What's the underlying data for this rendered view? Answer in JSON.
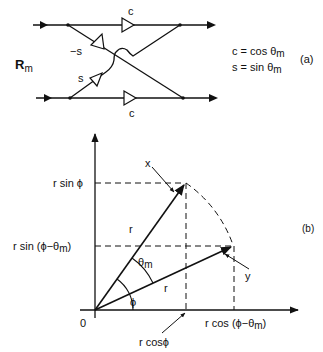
{
  "figure": {
    "panel_a": {
      "tag": "(a)",
      "operator_label": "R",
      "operator_subscript": "m",
      "top_gain_label": "c",
      "bottom_gain_label": "c",
      "cross_neg_gain_label": "−s",
      "cross_pos_gain_label": "s",
      "definitions": [
        {
          "lhs": "c",
          "eq": " = ",
          "rhs": "cos θ",
          "sub": "m"
        },
        {
          "lhs": "s",
          "eq": " = ",
          "rhs": "sin θ",
          "sub": "m"
        }
      ]
    },
    "panel_b": {
      "tag": "(b)",
      "origin_label": "0",
      "vector_x_label": "x",
      "vector_y_label": "y",
      "radius_label_x": "r",
      "radius_label_y": "r",
      "angle_phi_label": "ϕ",
      "angle_theta_label": "θ",
      "angle_theta_sub": "m",
      "y_tick_upper": "r sin ϕ",
      "y_tick_lower_pre": "r sin (",
      "y_tick_lower_mid": "ϕ−θ",
      "y_tick_lower_sub": "m",
      "y_tick_lower_post": ")",
      "x_tick_left": "r cosϕ",
      "x_tick_right_pre": "r cos (",
      "x_tick_right_mid": "ϕ−θ",
      "x_tick_right_sub": "m",
      "x_tick_right_post": ")"
    }
  }
}
